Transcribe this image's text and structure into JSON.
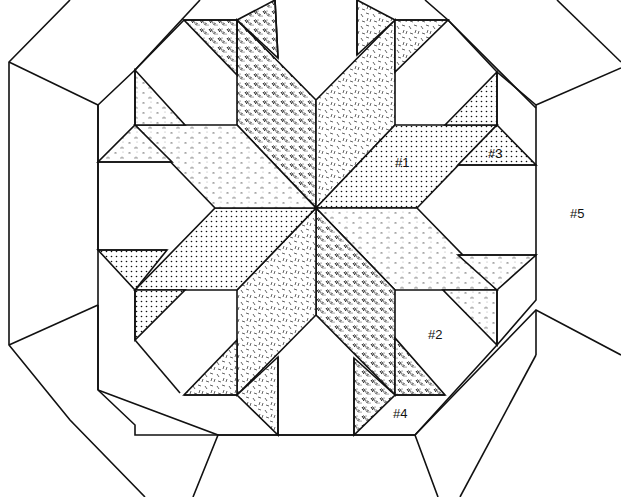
{
  "diagram": {
    "title": "",
    "type": "quilt-block-pattern",
    "colors": {
      "line": "#111111",
      "background": "#ffffff"
    },
    "fabrics": [
      {
        "id": "dots",
        "name": "fine-dot-print"
      },
      {
        "id": "dashes",
        "name": "dense-dash-print"
      },
      {
        "id": "scribble",
        "name": "scattered-line-print"
      },
      {
        "id": "mist",
        "name": "light-speckle-print"
      }
    ],
    "labels": [
      {
        "id": "piece-1",
        "text": "#1",
        "x": 395,
        "y": 163
      },
      {
        "id": "piece-2",
        "text": "#2",
        "x": 428,
        "y": 336
      },
      {
        "id": "piece-3",
        "text": "#3",
        "x": 488,
        "y": 155
      },
      {
        "id": "piece-4",
        "text": "#4",
        "x": 393,
        "y": 416
      },
      {
        "id": "piece-5",
        "text": "#5",
        "x": 570,
        "y": 216
      }
    ]
  }
}
